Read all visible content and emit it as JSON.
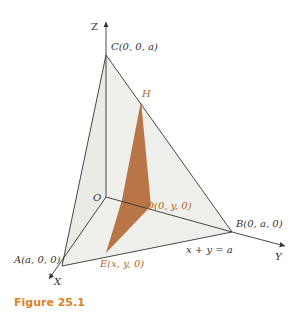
{
  "figure": {
    "caption": "Figure 25.1",
    "axes": {
      "z": "Z",
      "x": "X",
      "y": "Y"
    },
    "points": {
      "C": "C(0, 0, a)",
      "H": "H",
      "O": "O",
      "D": "D(0, y, 0)",
      "B": "B(0, a, 0)",
      "A": "A(a, 0, 0)",
      "E": "E(x, y, 0)"
    },
    "line_label": "x + y = a",
    "colors": {
      "face_fill": "#e6e6e2",
      "section_fill": "#b87548",
      "line": "#333333",
      "accent_label": "#b5651d",
      "caption": "#d9822b"
    }
  }
}
